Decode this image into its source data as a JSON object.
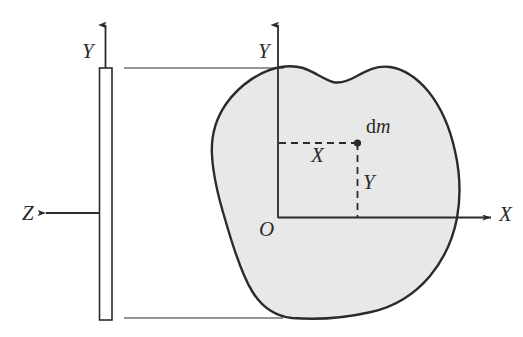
{
  "figure": {
    "type": "mechanics-diagram",
    "background_color": "#ffffff",
    "stroke_color": "#2b2b2b",
    "lamina_fill_color": "#e8e8e8",
    "labels": {
      "y_left": "Y",
      "y_main": "Y",
      "z_axis": "Z",
      "x_axis": "X",
      "origin": "O",
      "x_distance": "X",
      "y_distance": "Y",
      "mass_element_prefix": "d",
      "mass_element_symbol": "m"
    },
    "elements": {
      "plate_name": "thin-plate-edge-view",
      "lamina_name": "irregular-lamina",
      "mass_point_name": "differential-mass-element"
    }
  }
}
